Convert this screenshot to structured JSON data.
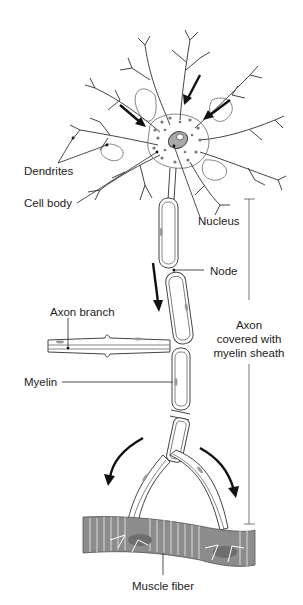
{
  "diagram": {
    "labels": {
      "dendrites": "Dendrites",
      "cell_body": "Cell body",
      "nucleus": "Nucleus",
      "node": "Node",
      "axon_branch": "Axon branch",
      "myelin": "Myelin",
      "axon_line1": "Axon",
      "axon_line2": "covered with",
      "axon_line3": "myelin sheath",
      "muscle_fiber": "Muscle fiber"
    },
    "colors": {
      "outline": "#444444",
      "arrow": "#111111",
      "nucleus_fill": "#a8a8a8",
      "muscle_fill": "#8c8c8c",
      "muscle_stripe": "#cfcfcf",
      "background": "#ffffff"
    },
    "arrows": {
      "signal_direction": [
        "toward cell body (3)",
        "down axon (1)",
        "toward muscle (2)"
      ]
    }
  }
}
